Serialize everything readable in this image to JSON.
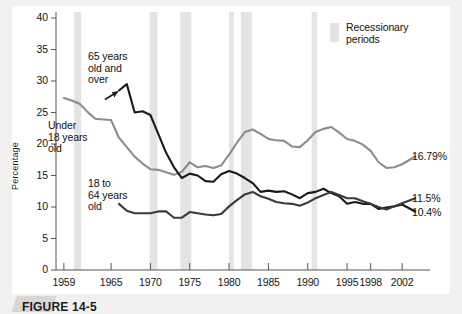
{
  "figure": {
    "caption": "FIGURE 14-5",
    "legend": {
      "label": "Recessionary\nperiods",
      "swatch_color": "#e4e4e4"
    }
  },
  "axes": {
    "ylabel": "Percentage",
    "y_ticks": [
      "0",
      "5",
      "10",
      "15",
      "20",
      "25",
      "30",
      "35",
      "40"
    ],
    "x_ticks": [
      "1959",
      "1965",
      "1970",
      "1975",
      "1980",
      "1985",
      "1990",
      "1995",
      "1998",
      "2002"
    ]
  },
  "annotations": [
    {
      "name": "under-18",
      "text": "Under\n18 years\nold"
    },
    {
      "name": "65-and-over",
      "text": "65 years\nold and\nover"
    },
    {
      "name": "18-to-64",
      "text": "18 to\n64 years\nold"
    }
  ],
  "end_labels": [
    {
      "name": "under-18-value",
      "text": "16.79%"
    },
    {
      "name": "18-to-64-value",
      "text": "11.5%"
    },
    {
      "name": "65-and-over-value",
      "text": "10.4%"
    }
  ],
  "chart_data": {
    "type": "line",
    "title": "",
    "xlabel": "",
    "ylabel": "Percentage",
    "xlim": [
      1958,
      2003
    ],
    "ylim": [
      0,
      40
    ],
    "grid": false,
    "legend_position": "top-right",
    "series": [
      {
        "name": "Under 18 years old",
        "color": "#8c8c8c",
        "end_value": "16.79%",
        "x": [
          1959,
          1960,
          1961,
          1962,
          1963,
          1964,
          1965,
          1966,
          1967,
          1968,
          1969,
          1970,
          1971,
          1972,
          1973,
          1974,
          1975,
          1976,
          1977,
          1978,
          1979,
          1980,
          1981,
          1982,
          1983,
          1984,
          1985,
          1986,
          1987,
          1988,
          1989,
          1990,
          1991,
          1992,
          1993,
          1994,
          1995,
          1996,
          1997,
          1998,
          1999,
          2000,
          2001,
          2002
        ],
        "y": [
          27.3,
          26.9,
          26.4,
          25.1,
          24.0,
          23.9,
          23.8,
          21.0,
          19.5,
          18.0,
          16.9,
          16.0,
          15.9,
          15.5,
          15.1,
          15.6,
          17.1,
          16.3,
          16.5,
          16.2,
          16.6,
          18.3,
          20.2,
          21.9,
          22.3,
          21.6,
          20.8,
          20.6,
          20.5,
          19.6,
          19.5,
          20.6,
          21.9,
          22.4,
          22.7,
          21.8,
          20.8,
          20.5,
          19.9,
          18.9,
          17.1,
          16.2,
          16.3,
          16.79
        ]
      },
      {
        "name": "65 years old and over",
        "color": "#1a1a1a",
        "end_value": "10.4%",
        "x": [
          1966,
          1967,
          1968,
          1969,
          1970,
          1971,
          1972,
          1973,
          1974,
          1975,
          1976,
          1977,
          1978,
          1979,
          1980,
          1981,
          1982,
          1983,
          1984,
          1985,
          1986,
          1987,
          1988,
          1989,
          1990,
          1991,
          1992,
          1993,
          1994,
          1995,
          1996,
          1997,
          1998,
          1999,
          2000,
          2001,
          2002
        ],
        "y": [
          28.5,
          29.5,
          25.0,
          25.2,
          24.6,
          21.6,
          18.6,
          16.3,
          14.6,
          15.3,
          15.0,
          14.1,
          14.0,
          15.2,
          15.7,
          15.3,
          14.6,
          13.8,
          12.4,
          12.6,
          12.4,
          12.5,
          12.0,
          11.4,
          12.2,
          12.4,
          12.9,
          12.2,
          11.7,
          10.5,
          10.8,
          10.5,
          10.5,
          9.7,
          9.9,
          10.1,
          10.4
        ]
      },
      {
        "name": "18 to 64 years old",
        "color": "#3a3a3a",
        "end_value": "11.5%",
        "x": [
          1966,
          1967,
          1968,
          1969,
          1970,
          1971,
          1972,
          1973,
          1974,
          1975,
          1976,
          1977,
          1978,
          1979,
          1980,
          1981,
          1982,
          1983,
          1984,
          1985,
          1986,
          1987,
          1988,
          1989,
          1990,
          1991,
          1992,
          1993,
          1994,
          1995,
          1996,
          1997,
          1998,
          1999,
          2000,
          2001,
          2002
        ],
        "y": [
          10.5,
          9.4,
          9.0,
          9.0,
          9.0,
          9.3,
          9.3,
          8.3,
          8.3,
          9.2,
          9.0,
          8.8,
          8.7,
          8.9,
          10.1,
          11.1,
          12.0,
          12.4,
          11.7,
          11.3,
          10.8,
          10.6,
          10.5,
          10.2,
          10.7,
          11.4,
          11.9,
          12.4,
          11.9,
          11.4,
          11.4,
          10.9,
          10.5,
          10.0,
          9.6,
          10.1,
          10.6
        ]
      }
    ],
    "recession_bands": [
      {
        "start": 1960.3,
        "end": 1961.2
      },
      {
        "start": 1969.9,
        "end": 1970.9
      },
      {
        "start": 1973.8,
        "end": 1975.2
      },
      {
        "start": 1980.0,
        "end": 1980.6
      },
      {
        "start": 1981.5,
        "end": 1982.9
      },
      {
        "start": 1990.5,
        "end": 1991.2
      }
    ]
  }
}
